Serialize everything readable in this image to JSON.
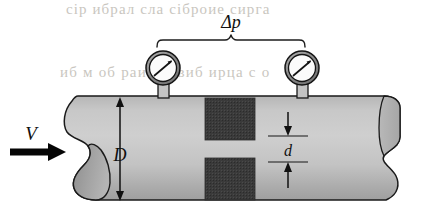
{
  "figure": {
    "name": "orifice-meter-pipe-diagram",
    "type": "engineering-schematic",
    "width": 424,
    "height": 211,
    "background_color": "#ffffff"
  },
  "labels": {
    "pressure_drop": "Δp",
    "velocity": "V",
    "pipe_diameter": "D",
    "orifice_diameter": "d"
  },
  "pipe": {
    "name": "horizontal-pipe",
    "fill_light": "#c2c2c2",
    "fill_dark": "#9a9a9a",
    "outline_color": "#1a1a1a",
    "left_x": 62,
    "right_x": 400,
    "top_y": 96,
    "bottom_y": 201
  },
  "orifice_plate": {
    "name": "orifice-plate",
    "fill_color": "#3b3b3b",
    "left_x": 205,
    "right_x": 255,
    "upper_top_y": 98,
    "upper_bottom_y": 140,
    "lower_top_y": 158,
    "lower_bottom_y": 200
  },
  "gauges": [
    {
      "name": "upstream-pressure-gauge",
      "center_x": 163,
      "center_y": 68,
      "outer_radius": 17,
      "inner_radius": 14,
      "ring_color": "#8c8c8c",
      "face_color": "#fbfbfb",
      "needle_color": "#141414",
      "needle_angle_deg": -38
    },
    {
      "name": "downstream-pressure-gauge",
      "center_x": 302,
      "center_y": 68,
      "outer_radius": 17,
      "inner_radius": 14,
      "ring_color": "#8c8c8c",
      "face_color": "#fbfbfb",
      "needle_color": "#141414",
      "needle_angle_deg": -38
    }
  ],
  "bracket": {
    "name": "pressure-drop-bracket",
    "left_x": 157,
    "right_x": 305,
    "baseline_y": 40,
    "stroke_color": "#1c1c1c"
  },
  "dimensions": {
    "pipe_diameter": {
      "name": "pipe-diameter-dimension",
      "x": 120,
      "top_y": 100,
      "bottom_y": 198,
      "label_y": 155
    },
    "orifice_diameter": {
      "name": "orifice-diameter-dimension",
      "x": 288,
      "top_y": 112,
      "bottom_y": 188,
      "upper_tick_y": 136,
      "lower_tick_y": 162,
      "label_y": 155
    }
  },
  "flow_arrow": {
    "name": "flow-direction-arrow",
    "start_x": 10,
    "end_x": 62,
    "y": 152,
    "color": "#050505",
    "label_x": 28,
    "label_y": 136
  },
  "scan_artifacts": {
    "top_band": "сір ибрал сла сіброие сирга",
    "middle_band": "иб м об раиб сбвиб ирца с о"
  }
}
